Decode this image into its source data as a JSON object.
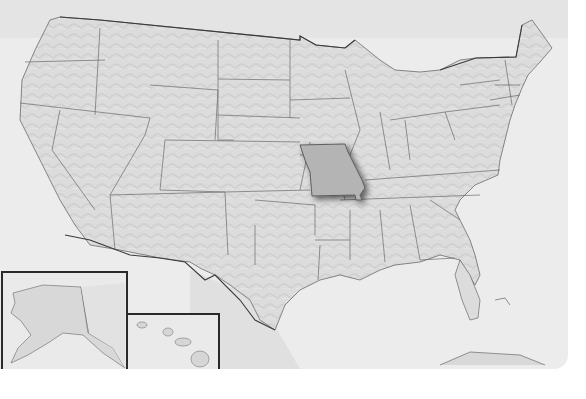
{
  "map": {
    "title": "United States",
    "highlighted_state": "Missouri",
    "colors": {
      "ocean": "#ececec",
      "land": "#d9d9d9",
      "land_light": "#e2e2e2",
      "border": "#6a6a6a",
      "intl_border": "#3a3a3a",
      "highlight": "#b4b4b4",
      "highlight_shadow": "#8a8a8a",
      "inset_border": "#2a2a2a"
    },
    "insets": [
      {
        "name": "Alaska"
      },
      {
        "name": "Hawaii"
      }
    ]
  }
}
